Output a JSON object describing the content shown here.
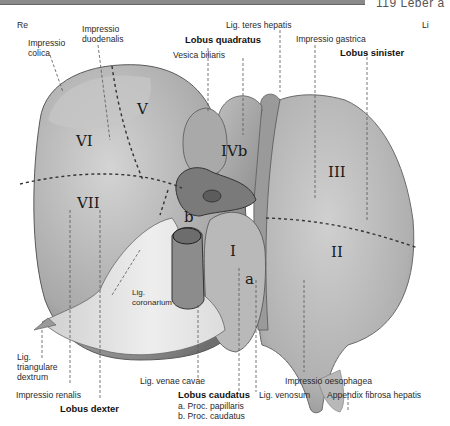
{
  "header": {
    "page_ref": "119 Leber a"
  },
  "orientation": {
    "right": "Re",
    "left": "Li"
  },
  "lobes": {
    "quadratus": "Lobus quadratus",
    "sinister": "Lobus sinister",
    "dexter": "Lobus dexter",
    "caudatus": "Lobus caudatus",
    "caudatus_a": "a. Proc. papillaris",
    "caudatus_b": "b. Proc. caudatus"
  },
  "labels": {
    "impressio_colica": "Impressio\ncolica",
    "impressio_duodenalis": "Impressio\nduodenalis",
    "vesica_biliaris": "Vesica biliaris",
    "lig_teres_hepatis": "Lig. teres hepatis",
    "impressio_gastrica": "Impressio gastrica",
    "lig_coronarium": "Lig.\ncoronarium",
    "lig_triangulare_dextrum": "Lig.\ntriangulare\ndextrum",
    "impressio_renalis": "Impressio renalis",
    "lig_venae_cavae": "Lig. venae cavae",
    "lig_venosum": "Lig. venosum",
    "impressio_oesophagea": "Impressio oesophagea",
    "appendix_fibrosa_hepatis": "Appendix fibrosa hepatis"
  },
  "segments": {
    "I": "I",
    "II": "II",
    "III": "III",
    "IVb": "IVb",
    "V": "V",
    "VI": "VI",
    "VII": "VII",
    "a": "a",
    "b": "b"
  }
}
